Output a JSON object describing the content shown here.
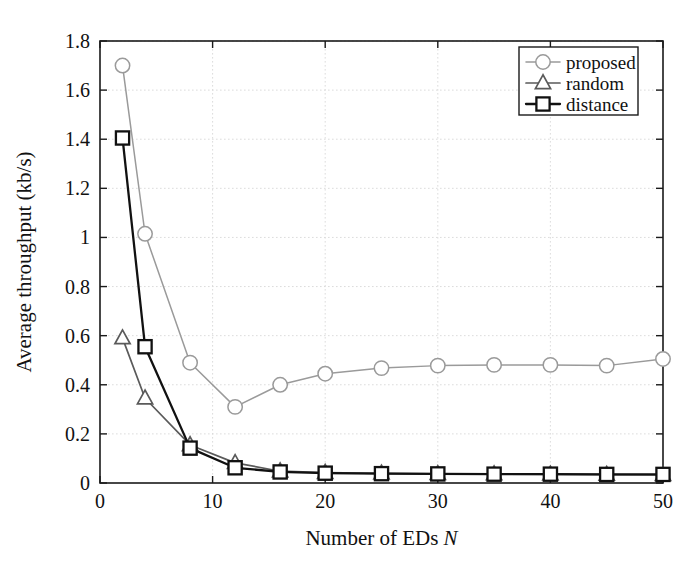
{
  "chart_data": {
    "type": "line",
    "title": "",
    "xlabel": "Number of EDs N",
    "xlabel_plain": "Number of EDs",
    "xlabel_italic": "N",
    "ylabel": "Average throughput (kb/s)",
    "xlim": [
      0,
      50
    ],
    "ylim": [
      0,
      1.8
    ],
    "xticks": [
      0,
      10,
      20,
      30,
      40,
      50
    ],
    "xtick_labels": [
      "0",
      "10",
      "20",
      "30",
      "40",
      "50"
    ],
    "yticks": [
      0,
      0.2,
      0.4,
      0.6,
      0.8,
      1,
      1.2,
      1.4,
      1.6,
      1.8
    ],
    "ytick_labels": [
      "0",
      "0.2",
      "0.4",
      "0.6",
      "0.8",
      "1",
      "1.2",
      "1.4",
      "1.6",
      "1.8"
    ],
    "grid": true,
    "legend_position": "upper right",
    "x": [
      2,
      4,
      8,
      12,
      16,
      20,
      25,
      30,
      35,
      40,
      45,
      50
    ],
    "series": [
      {
        "name": "proposed",
        "marker": "circle",
        "color": "#9a9a9a",
        "values": [
          1.7,
          1.015,
          0.49,
          0.31,
          0.4,
          0.445,
          0.468,
          0.478,
          0.481,
          0.481,
          0.478,
          0.505
        ]
      },
      {
        "name": "random",
        "marker": "triangle",
        "color": "#5a5a5a",
        "values": [
          0.59,
          0.345,
          0.155,
          0.082,
          0.048,
          0.042,
          0.039,
          0.037,
          0.036,
          0.035,
          0.034,
          0.033
        ]
      },
      {
        "name": "distance",
        "marker": "square",
        "color": "#111111",
        "values": [
          1.405,
          0.555,
          0.142,
          0.062,
          0.045,
          0.04,
          0.038,
          0.037,
          0.036,
          0.036,
          0.035,
          0.035
        ]
      }
    ]
  },
  "legend": {
    "entries": [
      {
        "label": "proposed"
      },
      {
        "label": "random"
      },
      {
        "label": "distance"
      }
    ]
  }
}
